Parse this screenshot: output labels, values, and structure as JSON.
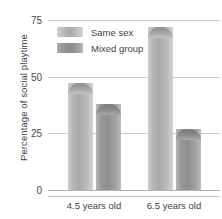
{
  "chart_data": {
    "type": "bar",
    "title": "",
    "xlabel": "",
    "ylabel": "Percentage of social playtime",
    "categories": [
      "4.5 years old",
      "6.5 years old"
    ],
    "series": [
      {
        "name": "Same sex",
        "values": [
          47,
          72
        ],
        "color": "#aaaaaa"
      },
      {
        "name": "Mixed group",
        "values": [
          38,
          27
        ],
        "color": "#8d8d8d"
      }
    ],
    "ylim": [
      0,
      75
    ],
    "yticks": [
      0,
      25,
      50,
      75
    ],
    "ytick_labels": [
      "0",
      "25",
      "50",
      "75"
    ],
    "grid": true,
    "legend_position": "top-left"
  },
  "axis": {
    "y_title": "Percentage of social playtime",
    "ticks": [
      {
        "label": "75",
        "value": 75
      },
      {
        "label": "50",
        "value": 50
      },
      {
        "label": "25",
        "value": 25
      },
      {
        "label": "0",
        "value": 0
      }
    ]
  },
  "legend": {
    "items": [
      {
        "label": "Same sex"
      },
      {
        "label": "Mixed group"
      }
    ]
  },
  "groups": [
    {
      "label": "4.5 years old",
      "same_sex": 47,
      "mixed_group": 38
    },
    {
      "label": "6.5 years old",
      "same_sex": 72,
      "mixed_group": 27
    }
  ]
}
